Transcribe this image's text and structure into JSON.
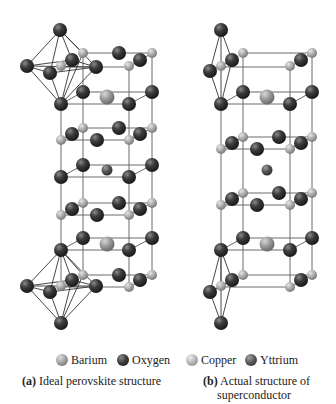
{
  "legend": {
    "items": [
      {
        "label": "Barium",
        "color": "#9a9a9a",
        "icon": "barium-sphere"
      },
      {
        "label": "Oxygen",
        "color": "#3a3a3a",
        "icon": "oxygen-sphere"
      },
      {
        "label": "Copper",
        "color": "#b8b8b8",
        "icon": "copper-sphere"
      },
      {
        "label": "Yttrium",
        "color": "#4a4a4a",
        "icon": "yttrium-sphere"
      }
    ]
  },
  "captions": {
    "a": {
      "tag": "(a)",
      "text": "Ideal perovskite structure"
    },
    "b": {
      "tag": "(b)",
      "line1": "Actual structure of",
      "line2": "superconductor"
    }
  },
  "colors": {
    "oxygen": "#3c3c3c",
    "copper": "#b4b4b4",
    "barium": "#a0a0a0",
    "yttrium": "#5a5a5a",
    "bond": "#555555"
  }
}
